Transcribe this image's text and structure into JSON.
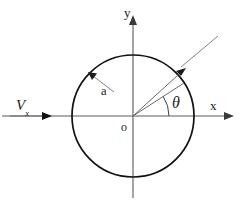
{
  "figure": {
    "background_color": "#ffffff",
    "width": 241,
    "height": 218
  },
  "labels": {
    "y_axis": "y",
    "x_axis": "x",
    "origin": "o",
    "radius": "a",
    "angle": "θ",
    "velocity_symbol": "V",
    "velocity_subscript": "x"
  },
  "colors": {
    "circle_stroke": "#111111",
    "axis_stroke": "#5a5a5a",
    "ray_stroke": "#6a6a6a",
    "leader_stroke": "#7a7a7a",
    "text": "#1b1b1b"
  },
  "geometry": {
    "center": {
      "x": 133,
      "y": 116
    },
    "radius": 61,
    "x_axis": {
      "from_x": 2,
      "to_x": 233,
      "y": 116
    },
    "y_axis": {
      "x": 133,
      "from_y": 196,
      "to_y": 16
    },
    "theta_degrees": 33,
    "theta_arc_radius": 36,
    "ray_outer_degrees": 45,
    "velocity_arrow": {
      "from_x": 10,
      "to_x": 50,
      "y": 116
    },
    "radius_leader": {
      "from_x": 113,
      "from_y": 91,
      "to_x": 88,
      "to_y": 72
    },
    "point_leader": {
      "from_x": 216,
      "from_y": 38,
      "to_x": 176,
      "to_y": 71
    }
  }
}
